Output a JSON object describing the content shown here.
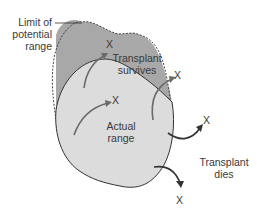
{
  "labels": {
    "limit": [
      "Limit of",
      "potential",
      "range"
    ],
    "transplant_survives": [
      "Transplant",
      "survives"
    ],
    "actual_range": [
      "Actual",
      "range"
    ],
    "transplant_dies": [
      "Transplant",
      "dies"
    ]
  },
  "markers": {
    "x": "X"
  },
  "colors": {
    "potential_range_fill": "#a8a8a8",
    "actual_range_fill": "#dcdcdc",
    "outline": "#333333",
    "arrow_light": "#6a6a6a",
    "arrow_dark": "#333333"
  }
}
